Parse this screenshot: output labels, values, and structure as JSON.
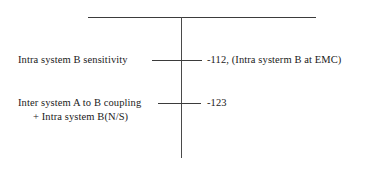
{
  "diagram": {
    "axis": {
      "orientation": "vertical",
      "top_rule": true,
      "color": "#3b3b3b"
    },
    "rows": [
      {
        "left_label": "Intra system B sensitivity",
        "left_label_continuation": "",
        "value": "-112, (Intra systerm B at EMC)"
      },
      {
        "left_label": "Inter system A to B coupling",
        "left_label_continuation": "+ Intra system B(N/S)",
        "value": "-123"
      }
    ]
  }
}
